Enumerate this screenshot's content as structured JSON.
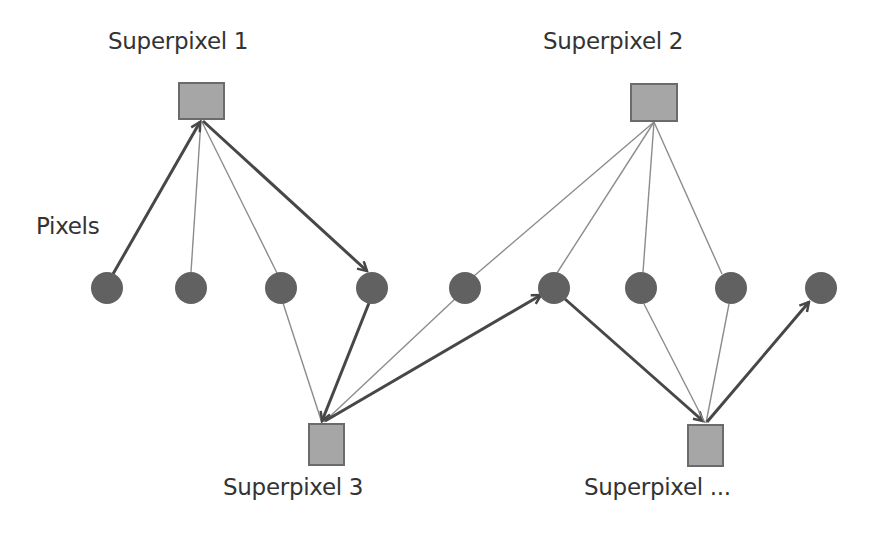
{
  "diagram": {
    "type": "graph",
    "labels": {
      "superpixel_1": "Superpixel 1",
      "superpixel_2": "Superpixel 2",
      "superpixel_3": "Superpixel 3",
      "superpixel_more": "Superpixel ...",
      "pixels": "Pixels"
    },
    "colors": {
      "superpixel_fill": "#a6a6a6",
      "superpixel_stroke": "#6b6b6b",
      "pixel_fill": "#616161",
      "thin_edge": "#8c8c8c",
      "thick_edge": "#474747",
      "text": "#333333"
    },
    "nodes": {
      "superpixels": [
        {
          "id": "S1",
          "label": "Superpixel 1",
          "position": "top"
        },
        {
          "id": "S2",
          "label": "Superpixel 2",
          "position": "top"
        },
        {
          "id": "S3",
          "label": "Superpixel 3",
          "position": "bottom"
        },
        {
          "id": "S4",
          "label": "Superpixel ...",
          "position": "bottom"
        }
      ],
      "pixels": [
        "P1",
        "P2",
        "P3",
        "P4",
        "P5",
        "P6",
        "P7",
        "P8",
        "P9"
      ]
    },
    "edges": [
      {
        "from": "P1",
        "to": "S1",
        "style": "thick-arrow"
      },
      {
        "from": "S1",
        "to": "P2",
        "style": "thin"
      },
      {
        "from": "S1",
        "to": "P3",
        "style": "thin"
      },
      {
        "from": "S1",
        "to": "P4",
        "style": "thick-arrow"
      },
      {
        "from": "S2",
        "to": "P5",
        "style": "thin"
      },
      {
        "from": "S2",
        "to": "P6",
        "style": "thin"
      },
      {
        "from": "S2",
        "to": "P7",
        "style": "thin"
      },
      {
        "from": "S2",
        "to": "P8",
        "style": "thin"
      },
      {
        "from": "P3",
        "to": "S3",
        "style": "thin"
      },
      {
        "from": "P4",
        "to": "S3",
        "style": "thick-arrow"
      },
      {
        "from": "P5",
        "to": "S3",
        "style": "thin"
      },
      {
        "from": "S3",
        "to": "P6",
        "style": "thick-arrow"
      },
      {
        "from": "P6",
        "to": "S4",
        "style": "thick-arrow"
      },
      {
        "from": "P7",
        "to": "S4",
        "style": "thin"
      },
      {
        "from": "P8",
        "to": "S4",
        "style": "thin"
      },
      {
        "from": "S4",
        "to": "P9",
        "style": "thick-arrow"
      }
    ]
  }
}
